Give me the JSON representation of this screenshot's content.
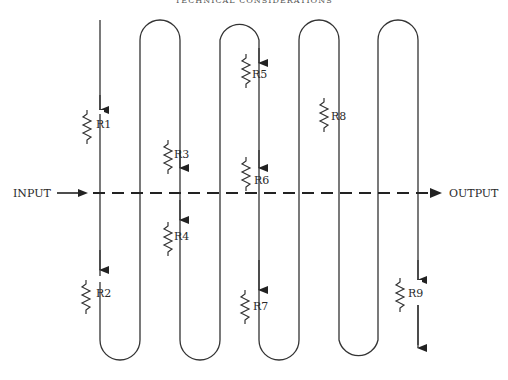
{
  "header": {
    "partial_text": "TECHNICAL CONSIDERATIONS"
  },
  "diagram": {
    "input_label": "INPUT",
    "output_label": "OUTPUT",
    "resistors": [
      {
        "id": "R1",
        "label": "R1"
      },
      {
        "id": "R2",
        "label": "R2"
      },
      {
        "id": "R3",
        "label": "R3"
      },
      {
        "id": "R4",
        "label": "R4"
      },
      {
        "id": "R5",
        "label": "R5"
      },
      {
        "id": "R6",
        "label": "R6"
      },
      {
        "id": "R7",
        "label": "R7"
      },
      {
        "id": "R8",
        "label": "R8"
      },
      {
        "id": "R9",
        "label": "R9"
      }
    ]
  },
  "colors": {
    "line": "#333333",
    "background": "#ffffff"
  }
}
